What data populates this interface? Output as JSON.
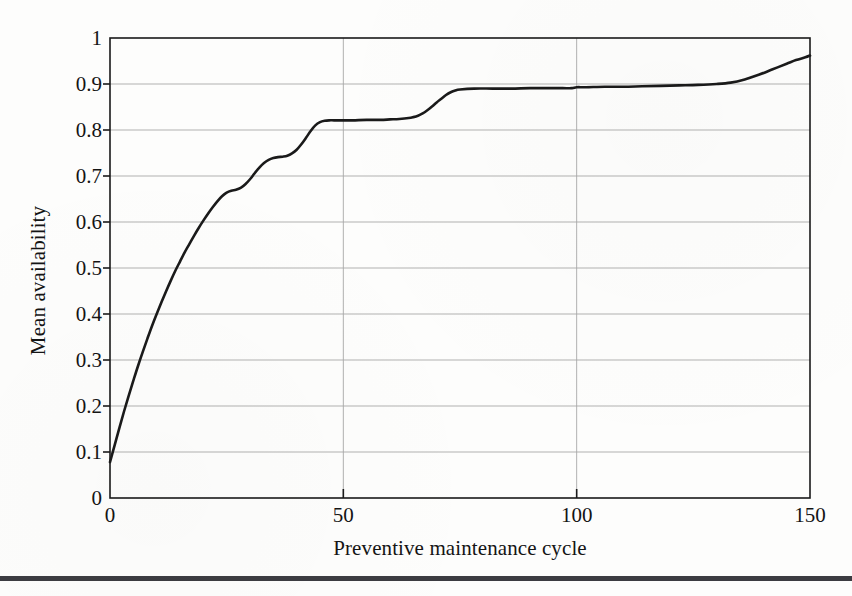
{
  "figure": {
    "background_color": "#fdfdfc",
    "line_color": "#1a1a1a",
    "grid_color": "#a8a8a8",
    "frame_color": "#1a1a1a",
    "footer_rule_color": "#3c3c41"
  },
  "axes": {
    "x_title": "Preventive maintenance cycle",
    "y_title": "Mean availability",
    "x_ticks": [
      "0",
      "50",
      "100",
      "150"
    ],
    "y_ticks": [
      "0",
      "0.1",
      "0.2",
      "0.3",
      "0.4",
      "0.5",
      "0.6",
      "0.7",
      "0.8",
      "0.9",
      "1"
    ]
  },
  "chart_data": {
    "type": "line",
    "title": "",
    "xlabel": "Preventive maintenance cycle",
    "ylabel": "Mean availability",
    "xlim": [
      0,
      150
    ],
    "ylim": [
      0,
      1
    ],
    "xticks": [
      0,
      50,
      100,
      150
    ],
    "yticks": [
      0,
      0.1,
      0.2,
      0.3,
      0.4,
      0.5,
      0.6,
      0.7,
      0.8,
      0.9,
      1
    ],
    "grid": "horizontal",
    "legend": "none",
    "series": [
      {
        "name": "Mean availability",
        "color": "#1a1a1a",
        "x": [
          0,
          1,
          2,
          3,
          4,
          5,
          6,
          7,
          8,
          9,
          10,
          11,
          12,
          13,
          14,
          15,
          16,
          17,
          18,
          19,
          20,
          21,
          22,
          23,
          24,
          25,
          26,
          27,
          28,
          29,
          30,
          31,
          32,
          33,
          34,
          35,
          36,
          37,
          38,
          39,
          40,
          41,
          42,
          43,
          44,
          45,
          46,
          47,
          48,
          50,
          52,
          55,
          58,
          60,
          62,
          64,
          65,
          66,
          67,
          68,
          69,
          70,
          71,
          72,
          73,
          74,
          75,
          78,
          82,
          86,
          90,
          94,
          97,
          99,
          100,
          102,
          106,
          110,
          114,
          118,
          122,
          126,
          130,
          133,
          136,
          139,
          142,
          145,
          147,
          149,
          150
        ],
        "y": [
          0.078,
          0.115,
          0.152,
          0.188,
          0.222,
          0.255,
          0.287,
          0.317,
          0.346,
          0.374,
          0.4,
          0.425,
          0.449,
          0.472,
          0.494,
          0.514,
          0.534,
          0.552,
          0.57,
          0.587,
          0.603,
          0.618,
          0.632,
          0.645,
          0.656,
          0.664,
          0.668,
          0.67,
          0.674,
          0.682,
          0.693,
          0.706,
          0.718,
          0.728,
          0.735,
          0.739,
          0.741,
          0.742,
          0.744,
          0.749,
          0.757,
          0.769,
          0.783,
          0.798,
          0.81,
          0.817,
          0.82,
          0.821,
          0.821,
          0.821,
          0.821,
          0.822,
          0.822,
          0.823,
          0.824,
          0.826,
          0.828,
          0.831,
          0.836,
          0.843,
          0.851,
          0.86,
          0.868,
          0.876,
          0.882,
          0.886,
          0.888,
          0.89,
          0.89,
          0.89,
          0.891,
          0.891,
          0.891,
          0.891,
          0.893,
          0.893,
          0.894,
          0.894,
          0.895,
          0.896,
          0.897,
          0.898,
          0.9,
          0.903,
          0.91,
          0.92,
          0.932,
          0.944,
          0.952,
          0.958,
          0.962
        ]
      }
    ]
  }
}
